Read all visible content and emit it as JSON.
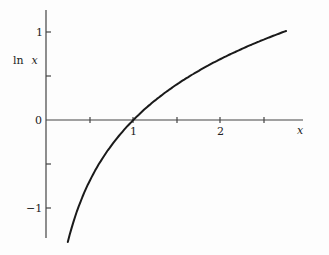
{
  "chart_data": {
    "type": "line",
    "title": "",
    "xlabel": "x",
    "ylabel": "ln x",
    "ylabel_parts": {
      "fn": "ln",
      "var": "x"
    },
    "xlim": [
      0,
      2.95
    ],
    "ylim": [
      -1.4,
      1.25
    ],
    "x_ticks": [
      0.5,
      1,
      1.5,
      2,
      2.5
    ],
    "x_tick_labels": {
      "1": "1",
      "2": "2"
    },
    "y_ticks": [
      -1,
      -0.5,
      0,
      0.5,
      1
    ],
    "y_tick_labels": {
      "1": "1",
      "0": "0",
      "-1": "−1"
    },
    "grid": false,
    "legend": null,
    "series": [
      {
        "name": "ln x",
        "color": "#1a1a1a",
        "x": [
          0.25,
          0.3,
          0.4,
          0.5,
          0.6,
          0.7,
          0.8,
          0.9,
          1.0,
          1.2,
          1.4,
          1.6,
          1.8,
          2.0,
          2.2,
          2.4,
          2.6,
          2.75
        ],
        "values": [
          -1.386,
          -1.204,
          -0.916,
          -0.693,
          -0.511,
          -0.357,
          -0.223,
          -0.105,
          0.0,
          0.182,
          0.336,
          0.47,
          0.588,
          0.693,
          0.788,
          0.875,
          0.956,
          1.012
        ]
      }
    ]
  },
  "labels": {
    "y_tick_1": "1",
    "y_tick_0": "0",
    "y_tick_neg1": "−1",
    "x_tick_1": "1",
    "x_tick_2": "2",
    "x_axis": "x",
    "y_axis_fn": "ln",
    "y_axis_var": "x"
  }
}
